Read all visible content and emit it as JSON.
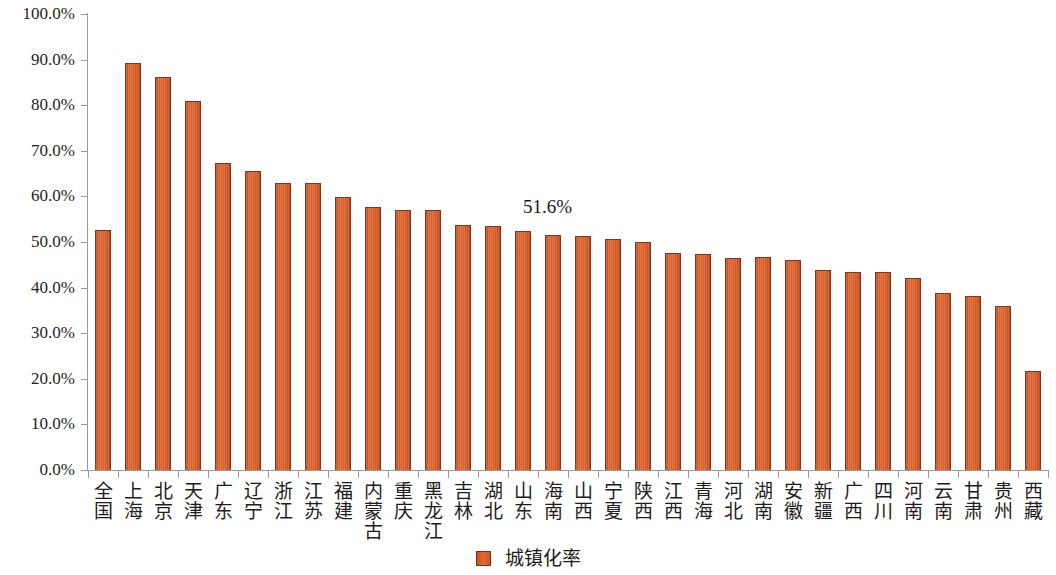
{
  "chart_data": {
    "type": "bar",
    "title": "",
    "xlabel": "",
    "ylabel": "",
    "ylim": [
      0,
      100
    ],
    "grid": false,
    "legend_position": "bottom",
    "y_ticks": [
      "0.0%",
      "10.0%",
      "20.0%",
      "30.0%",
      "40.0%",
      "50.0%",
      "60.0%",
      "70.0%",
      "80.0%",
      "90.0%",
      "100.0%"
    ],
    "y_tick_values": [
      0,
      10,
      20,
      30,
      40,
      50,
      60,
      70,
      80,
      90,
      100
    ],
    "categories": [
      "全国",
      "上海",
      "北京",
      "天津",
      "广东",
      "辽宁",
      "浙江",
      "江苏",
      "福建",
      "内蒙古",
      "重庆",
      "黑龙江",
      "吉林",
      "湖北",
      "山东",
      "海南",
      "山西",
      "宁夏",
      "陕西",
      "江西",
      "青海",
      "河北",
      "湖南",
      "安徽",
      "新疆",
      "广西",
      "四川",
      "河南",
      "云南",
      "甘肃",
      "贵州",
      "西藏"
    ],
    "series": [
      {
        "name": "城镇化率",
        "color": "#d85f2c",
        "values": [
          52.6,
          89.3,
          86.2,
          81.0,
          67.4,
          65.6,
          62.9,
          63.0,
          59.9,
          57.7,
          57.0,
          57.0,
          53.7,
          53.5,
          52.4,
          51.6,
          51.3,
          50.7,
          50.0,
          47.5,
          47.4,
          46.5,
          46.7,
          46.0,
          43.9,
          43.5,
          43.5,
          42.2,
          38.8,
          38.2,
          36.0,
          21.8
        ]
      }
    ],
    "annotations": [
      {
        "text": "51.6%",
        "x_index": 15,
        "value": 51.6
      }
    ],
    "legend": [
      {
        "label": "城镇化率",
        "color": "#d85f2c"
      }
    ]
  }
}
